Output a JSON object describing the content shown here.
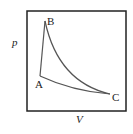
{
  "diagram": {
    "type": "pV-diagram",
    "axes": {
      "x_label": "V",
      "y_label": "p"
    },
    "points": [
      {
        "name": "A",
        "label": "A",
        "x": 40,
        "y": 76
      },
      {
        "name": "B",
        "label": "B",
        "x": 45,
        "y": 21
      },
      {
        "name": "C",
        "label": "C",
        "x": 110,
        "y": 94
      }
    ],
    "processes": [
      {
        "from": "A",
        "to": "B",
        "shape": "straight"
      },
      {
        "from": "B",
        "to": "C",
        "shape": "curve"
      },
      {
        "from": "C",
        "to": "A",
        "shape": "curve"
      }
    ],
    "colors": {
      "frame": "#222222",
      "curve": "#555555",
      "text": "#222222"
    }
  }
}
